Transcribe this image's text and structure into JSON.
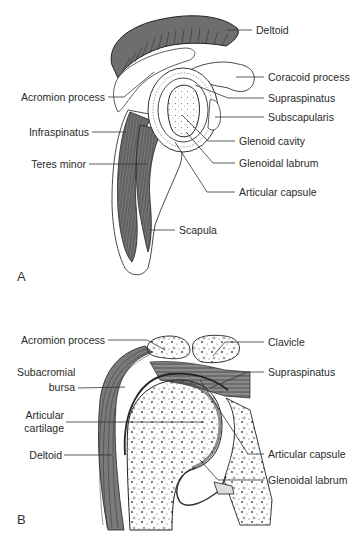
{
  "figure": {
    "panels": [
      {
        "letter": "A",
        "view": "Lateral view of scapula showing glenoid cavity and rotator cuff",
        "labels": {
          "deltoid": "Deltoid",
          "coracoid_process": "Coracoid process",
          "acromion_process": "Acromion process",
          "supraspinatus": "Supraspinatus",
          "subscapularis": "Subscapularis",
          "infraspinatus": "Infraspinatus",
          "glenoid_cavity": "Glenoid cavity",
          "teres_minor": "Teres minor",
          "glenoidal_labrum": "Glenoidal labrum",
          "articular_capsule": "Articular capsule",
          "scapula": "Scapula"
        }
      },
      {
        "letter": "B",
        "view": "Coronal section of the shoulder joint",
        "labels": {
          "acromion_process": "Acromion process",
          "clavicle": "Clavicle",
          "subacromial_bursa_1": "Subacromial",
          "subacromial_bursa_2": "bursa",
          "supraspinatus": "Supraspinatus",
          "articular_cartilage_1": "Articular",
          "articular_cartilage_2": "cartilage",
          "deltoid": "Deltoid",
          "articular_capsule": "Articular capsule",
          "glenoidal_labrum": "Glenoidal labrum"
        }
      }
    ],
    "colors": {
      "ink": "#2a2a2a",
      "muscle_fill": "#6e6e6e",
      "muscle_dark": "#555555",
      "bone_fill": "#ffffff",
      "background": "#ffffff"
    }
  }
}
